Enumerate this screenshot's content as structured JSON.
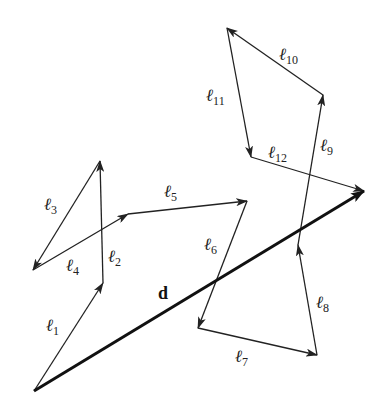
{
  "diagram": {
    "resultant": {
      "label": "d",
      "from": [
        34,
        391
      ],
      "to": [
        364,
        191
      ],
      "label_pos": [
        158,
        299
      ]
    },
    "segments": [
      {
        "name": "l1",
        "label": "ℓ",
        "sub": "1",
        "from": [
          34,
          391
        ],
        "to": [
          103,
          283
        ],
        "label_pos": [
          46,
          331
        ]
      },
      {
        "name": "l2",
        "label": "ℓ",
        "sub": "2",
        "from": [
          103,
          283
        ],
        "to": [
          100,
          161
        ],
        "label_pos": [
          108,
          262
        ]
      },
      {
        "name": "l3",
        "label": "ℓ",
        "sub": "3",
        "from": [
          100,
          161
        ],
        "to": [
          33,
          270
        ],
        "label_pos": [
          44,
          210
        ]
      },
      {
        "name": "l4",
        "label": "ℓ",
        "sub": "4",
        "from": [
          33,
          270
        ],
        "to": [
          128,
          214
        ],
        "label_pos": [
          66,
          271
        ]
      },
      {
        "name": "l5",
        "label": "ℓ",
        "sub": "5",
        "from": [
          128,
          214
        ],
        "to": [
          247,
          201
        ],
        "label_pos": [
          164,
          197
        ]
      },
      {
        "name": "l6",
        "label": "ℓ",
        "sub": "6",
        "from": [
          247,
          201
        ],
        "to": [
          198,
          328
        ],
        "label_pos": [
          204,
          250
        ]
      },
      {
        "name": "l7",
        "label": "ℓ",
        "sub": "7",
        "from": [
          198,
          328
        ],
        "to": [
          317,
          355
        ],
        "label_pos": [
          235,
          362
        ]
      },
      {
        "name": "l8",
        "label": "ℓ",
        "sub": "8",
        "from": [
          317,
          355
        ],
        "to": [
          298,
          245
        ],
        "label_pos": [
          316,
          308
        ]
      },
      {
        "name": "l9",
        "label": "ℓ",
        "sub": "9",
        "from": [
          298,
          245
        ],
        "to": [
          323,
          95
        ],
        "label_pos": [
          320,
          151
        ]
      },
      {
        "name": "l10",
        "label": "ℓ",
        "sub": "10",
        "from": [
          323,
          95
        ],
        "to": [
          227,
          28
        ],
        "label_pos": [
          279,
          60
        ]
      },
      {
        "name": "l11",
        "label": "ℓ",
        "sub": "11",
        "from": [
          227,
          28
        ],
        "to": [
          251,
          157
        ],
        "label_pos": [
          206,
          101
        ]
      },
      {
        "name": "l12",
        "label": "ℓ",
        "sub": "12",
        "from": [
          251,
          157
        ],
        "to": [
          364,
          191
        ],
        "label_pos": [
          268,
          158
        ]
      }
    ]
  },
  "colors": {
    "stroke": "#222222",
    "resultant": "#111111",
    "background": "#ffffff"
  }
}
